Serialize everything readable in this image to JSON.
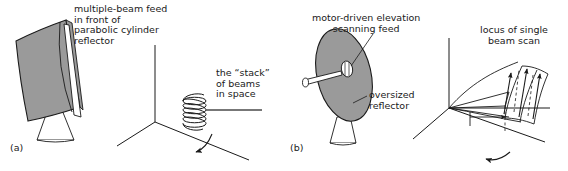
{
  "figure": {
    "background_color": "#ffffff",
    "line_color": "#1a1a1a",
    "fill_gray": "#9a9a9a",
    "text_color": "#1a1a1a",
    "width": 568,
    "height": 171
  },
  "panel_a": {
    "label": "(a)",
    "antenna_caption": "multiple-beam feed\nin front of\nparabolic cylinder\nreflector",
    "antenna_caption_lines": [
      "multiple-beam feed",
      "in front of",
      "parabolic cylinder",
      "reflector"
    ],
    "beam_caption": "the “stack”\nof beams\nin space",
    "beam_caption_lines": [
      "the “stack”",
      "of beams",
      "in space"
    ],
    "elements": {
      "reflector_name": "parabolic-cylinder-reflector",
      "feed_name": "line-feed",
      "pedestal_name": "pedestal",
      "axes_name": "coordinate-axes",
      "helix_name": "beam-stack-helix",
      "helix_turns": 8,
      "azimuth_arrow_name": "azimuth-rotation-arrow"
    }
  },
  "panel_b": {
    "label": "(b)",
    "feed_caption": "motor-driven elevation\nscanning feed",
    "feed_caption_lines": [
      "motor-driven elevation",
      "scanning feed"
    ],
    "reflector_caption": "oversized\nreflector",
    "reflector_caption_lines": [
      "oversized",
      "reflector"
    ],
    "locus_caption": "locus of single\nbeam scan",
    "locus_caption_lines": [
      "locus of single",
      "beam  scan"
    ],
    "elements": {
      "reflector_name": "oversized-dish-reflector",
      "feed_name": "scanning-feed-horn",
      "feed_arm_name": "feed-support-arm",
      "pedestal_name": "pedestal",
      "axes_name": "coordinate-axes",
      "beam_fan_name": "scanned-beam-fan",
      "scan_arrows_count": 3,
      "azimuth_arrow_name": "azimuth-rotation-arrow"
    }
  }
}
